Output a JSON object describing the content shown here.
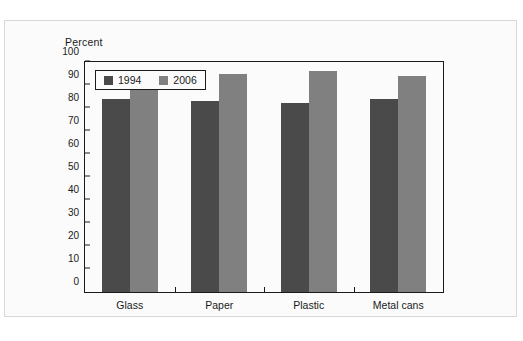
{
  "figure": {
    "axis_title": "Percent"
  },
  "chart_data": {
    "type": "bar",
    "title": "",
    "subtitle": "",
    "xlabel": "",
    "ylabel": "Percent",
    "categories": [
      "Glass",
      "Paper",
      "Plastic",
      "Metal cans"
    ],
    "series": [
      {
        "name": "1994",
        "color": "#4a4a4a",
        "values": [
          84,
          83,
          82,
          84
        ]
      },
      {
        "name": "2006",
        "color": "#808080",
        "values": [
          94,
          95,
          96,
          94
        ]
      }
    ],
    "ylim": [
      0,
      100
    ],
    "ytick_step": 10,
    "yticks": [
      0,
      10,
      20,
      30,
      40,
      50,
      60,
      70,
      80,
      90,
      100
    ],
    "ytick_labels": [
      "0",
      "10",
      "20",
      "30",
      "40",
      "50",
      "60",
      "70",
      "80",
      "90",
      "100"
    ],
    "grid": false,
    "legend_position": "upper-left-inside",
    "legend_entries": [
      "1994",
      "2006"
    ]
  },
  "colors": {
    "series_1994": "#4a4a4a",
    "series_2006": "#808080",
    "axis": "#1a1a1a",
    "panel_border": "#d8d8d8",
    "plot_background": "#fbfbfb"
  }
}
